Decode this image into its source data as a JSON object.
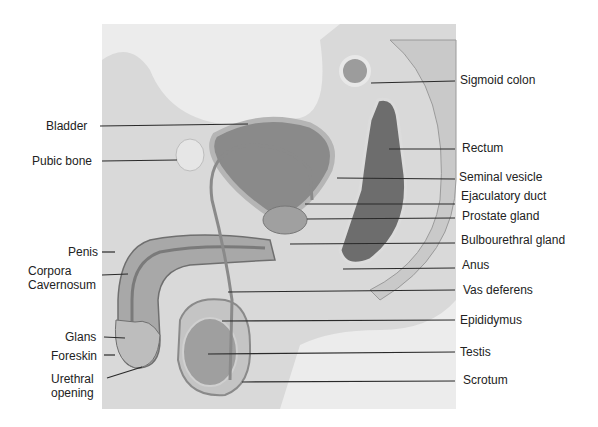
{
  "diagram": {
    "background": "#ffffff",
    "line_color": "#2a2a2a",
    "left_labels": [
      {
        "id": "bladder",
        "text": "Bladder",
        "x": 46,
        "y": 119,
        "line": [
          100,
          126,
          248,
          124
        ]
      },
      {
        "id": "pubic-bone",
        "text": "Pubic bone",
        "x": 32,
        "y": 154,
        "line": [
          102,
          161,
          177,
          160
        ]
      },
      {
        "id": "penis",
        "text": "Penis",
        "x": 68,
        "y": 245,
        "line": [
          102,
          252,
          115,
          252
        ]
      },
      {
        "id": "corpora-cavernosum",
        "text": "Corpora\nCavernosum",
        "x": 28,
        "y": 264,
        "line": [
          102,
          275,
          128,
          274
        ]
      },
      {
        "id": "glans",
        "text": "Glans",
        "x": 65,
        "y": 330,
        "line": [
          104,
          337,
          125,
          338
        ]
      },
      {
        "id": "foreskin",
        "text": "Foreskin",
        "x": 51,
        "y": 349,
        "line": [
          104,
          355,
          115,
          355
        ]
      },
      {
        "id": "urethral-opening",
        "text": "Urethral\nopening",
        "x": 51,
        "y": 372,
        "line": [
          107,
          378,
          142,
          367
        ]
      }
    ],
    "right_labels": [
      {
        "id": "sigmoid-colon",
        "text": "Sigmoid colon",
        "x": 460,
        "y": 73,
        "line": [
          371,
          83,
          455,
          81
        ]
      },
      {
        "id": "rectum",
        "text": "Rectum",
        "x": 462,
        "y": 141,
        "line": [
          389,
          149,
          455,
          149
        ]
      },
      {
        "id": "seminal-vesicle",
        "text": "Seminal vesicle",
        "x": 459,
        "y": 170,
        "line": [
          337,
          178,
          455,
          179
        ]
      },
      {
        "id": "ejaculatory-duct",
        "text": "Ejaculatory duct",
        "x": 461,
        "y": 189,
        "line": [
          305,
          204,
          455,
          204
        ]
      },
      {
        "id": "prostate-gland",
        "text": "Prostate gland",
        "x": 462,
        "y": 209,
        "line": [
          307,
          219,
          455,
          218
        ]
      },
      {
        "id": "bulbourethral-gland",
        "text": "Bulbourethral gland",
        "x": 461,
        "y": 233,
        "line": [
          290,
          244,
          455,
          243
        ]
      },
      {
        "id": "anus",
        "text": "Anus",
        "x": 462,
        "y": 258,
        "line": [
          343,
          269,
          455,
          268
        ]
      },
      {
        "id": "vas-deferens",
        "text": "Vas deferens",
        "x": 463,
        "y": 283,
        "line": [
          228,
          292,
          455,
          290
        ]
      },
      {
        "id": "epididymus",
        "text": "Epididymus",
        "x": 460,
        "y": 313,
        "line": [
          222,
          321,
          455,
          320
        ]
      },
      {
        "id": "testis",
        "text": "Testis",
        "x": 460,
        "y": 345,
        "line": [
          208,
          354,
          455,
          352
        ]
      },
      {
        "id": "scrotum",
        "text": "Scrotum",
        "x": 463,
        "y": 373,
        "line": [
          242,
          382,
          455,
          381
        ]
      }
    ]
  }
}
